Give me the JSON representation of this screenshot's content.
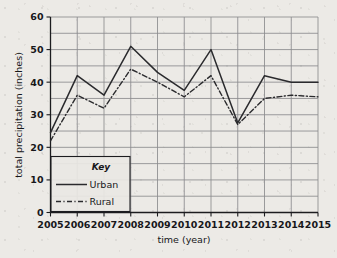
{
  "chart_data": {
    "type": "line",
    "title": "",
    "xlabel": "time (year)",
    "ylabel": "total precipitation (inches)",
    "categories": [
      2005,
      2006,
      2007,
      2008,
      2009,
      2010,
      2011,
      2012,
      2013,
      2014,
      2015
    ],
    "xtick_labels": [
      "2005",
      "2006",
      "2007",
      "2008",
      "2009",
      "2010",
      "2011",
      "2012",
      "2013",
      "2014",
      "2015"
    ],
    "ytick_labels": [
      "0",
      "10",
      "20",
      "30",
      "40",
      "50",
      "60"
    ],
    "ytick_values": [
      0,
      10,
      20,
      30,
      40,
      50,
      60
    ],
    "ylim": [
      0,
      60
    ],
    "xlim": [
      2005,
      2015
    ],
    "minor_gridline_step": 5,
    "grid": true,
    "legend_position": "lower-left-inside",
    "legend_title": "Key",
    "series": [
      {
        "name": "Urban",
        "style": "solid",
        "values": [
          24.5,
          42.0,
          36.0,
          51.0,
          43.0,
          37.5,
          50.0,
          27.5,
          42.0,
          40.0,
          40.0
        ]
      },
      {
        "name": "Rural",
        "style": "dash-dot",
        "values": [
          22.0,
          36.0,
          32.0,
          44.0,
          40.0,
          35.5,
          42.0,
          27.0,
          35.0,
          36.0,
          35.5
        ]
      }
    ],
    "colors": {
      "urban_line": "#2a2a2d",
      "rural_line": "#2a2a2d",
      "gridline": "#8b8b8e",
      "axis": "#1c1c1f",
      "background": "#eceae6"
    }
  }
}
